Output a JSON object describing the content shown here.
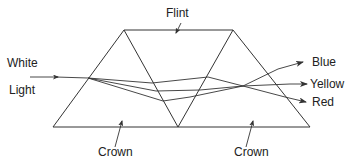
{
  "diagram": {
    "labels": {
      "top": "Flint",
      "input_line1": "White",
      "input_line2": "Light",
      "bottom_left": "Crown",
      "bottom_right": "Crown",
      "out_blue": "Blue",
      "out_yellow": "Yellow",
      "out_red": "Red"
    },
    "components": [
      {
        "name": "Crown",
        "shape": "triangle",
        "position": "left"
      },
      {
        "name": "Flint",
        "shape": "inverted triangle",
        "position": "center"
      },
      {
        "name": "Crown",
        "shape": "triangle",
        "position": "right"
      }
    ],
    "rays": {
      "input": "White Light",
      "outputs": [
        "Blue",
        "Yellow",
        "Red"
      ]
    },
    "colors": {
      "line": "#333333",
      "text": "#222222",
      "background": "#ffffff"
    }
  }
}
